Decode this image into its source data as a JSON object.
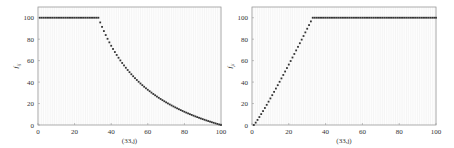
{
  "chart_data": [
    {
      "type": "scatter",
      "title": "",
      "xlabel": "(33,j)",
      "ylabel": "f_ij",
      "xlim": [
        0,
        100
      ],
      "ylim": [
        0,
        110
      ],
      "xticks": [
        0,
        20,
        40,
        60,
        80,
        100
      ],
      "yticks": [
        0,
        20,
        40,
        60,
        80,
        100
      ],
      "grid": true,
      "legend": null,
      "description": "Flat at 100 for j=1..33, then decreasing convex curve to 0 at j=100",
      "series": [
        {
          "name": "f_ij",
          "x": [
            1,
            5,
            10,
            15,
            20,
            25,
            30,
            33,
            35,
            40,
            45,
            50,
            55,
            60,
            65,
            70,
            75,
            80,
            85,
            90,
            95,
            100
          ],
          "values": [
            100,
            100,
            100,
            100,
            100,
            100,
            100,
            100,
            92,
            74,
            60,
            49,
            40,
            33,
            27,
            21,
            16,
            12,
            9,
            5,
            3,
            0
          ]
        }
      ]
    },
    {
      "type": "scatter",
      "title": "",
      "xlabel": "(33,j)",
      "ylabel": "f_ji",
      "xlim": [
        0,
        100
      ],
      "ylim": [
        0,
        110
      ],
      "xticks": [
        0,
        20,
        40,
        60,
        80,
        100
      ],
      "yticks": [
        0,
        20,
        40,
        60,
        80,
        100
      ],
      "grid": true,
      "legend": null,
      "description": "Rising from 0 at j=1 to 100 at j=33, then flat at 100 up to j=100",
      "series": [
        {
          "name": "f_ji",
          "x": [
            1,
            5,
            10,
            15,
            20,
            25,
            30,
            33,
            40,
            50,
            60,
            70,
            80,
            90,
            100
          ],
          "values": [
            2,
            10,
            24,
            39,
            54,
            70,
            88,
            100,
            100,
            100,
            100,
            100,
            100,
            100,
            100
          ]
        }
      ]
    }
  ],
  "plots": [
    {
      "ylabel_main": "f",
      "ylabel_sub": "ij",
      "xlabel": "(33,j)"
    },
    {
      "ylabel_main": "f",
      "ylabel_sub": "ji",
      "xlabel": "(33,j)"
    }
  ],
  "colors": {
    "marker": "#333333",
    "frame": "#999999",
    "grid": "#e6e6e6"
  }
}
